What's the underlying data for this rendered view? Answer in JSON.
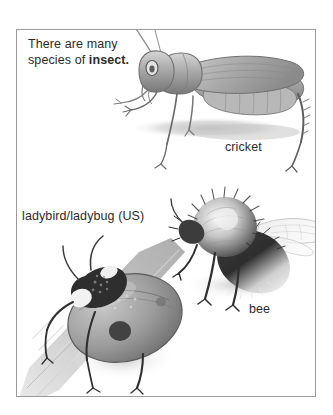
{
  "panel": {
    "caption_text_plain": "There are many species of insect.",
    "caption_lead": "There are many species of ",
    "caption_bold": "insect.",
    "border_color": "#9a9a9a",
    "background": "#ffffff"
  },
  "labels": {
    "cricket": "cricket",
    "ladybird": "ladybird/ladybug (US)",
    "bee": "bee"
  },
  "illustrations": [
    {
      "name": "cricket-illustration",
      "subject": "cricket",
      "style": "grayscale pencil drawing",
      "ink": "#6f6f6f"
    },
    {
      "name": "bee-illustration",
      "subject": "bee",
      "style": "grayscale pencil drawing",
      "ink": "#4a4a4a"
    },
    {
      "name": "ladybird-illustration",
      "subject": "ladybird/ladybug (US)",
      "style": "grayscale pencil drawing",
      "ink": "#5d5d5d"
    }
  ],
  "colors": {
    "text": "#2b2b2b",
    "frame": "#9a9a9a",
    "shadow": "#c9c9c9",
    "mid_gray": "#9b9b9b",
    "dark_gray": "#3d3d3d",
    "light_gray": "#d8d8d8"
  }
}
